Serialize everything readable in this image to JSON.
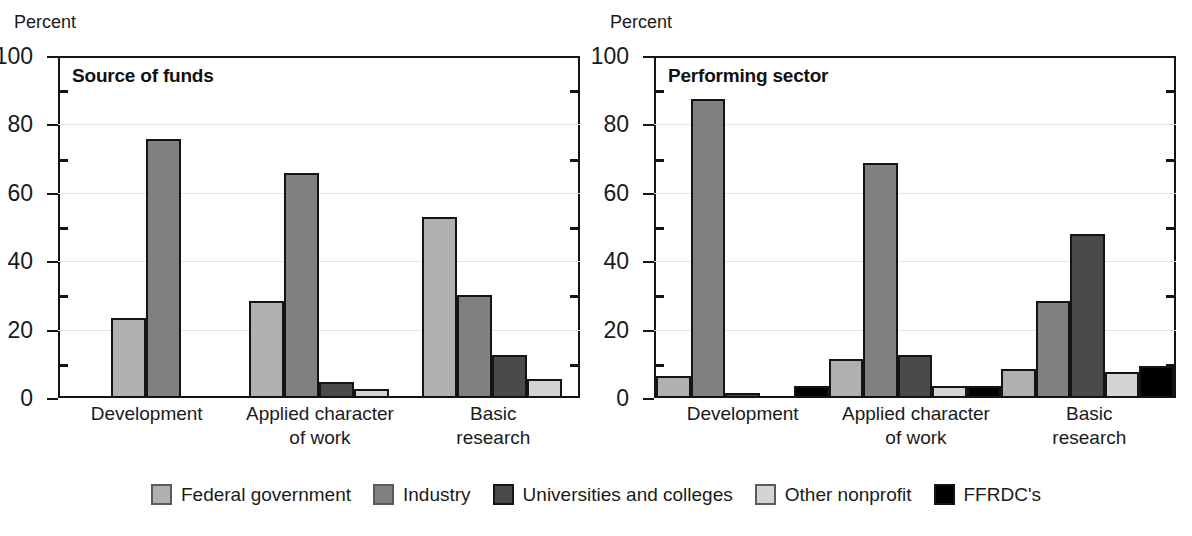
{
  "chart_data": {
    "type": "bar",
    "title": "",
    "panels": [
      {
        "title": "Source of funds",
        "ylabel": "Percent",
        "ylim": [
          0,
          100
        ],
        "yticks": [
          0,
          20,
          40,
          60,
          80,
          100
        ],
        "yticks_minor": [
          10,
          30,
          50,
          70,
          90
        ],
        "grid": true,
        "categories": [
          "Development",
          "Applied character of work",
          "Basic research"
        ],
        "series": [
          {
            "name": "Federal government",
            "values": [
              23,
              28,
              53
            ]
          },
          {
            "name": "Industry",
            "values": [
              76,
              66,
              30
            ]
          },
          {
            "name": "Universities and colleges",
            "values": [
              0,
              4,
              12
            ]
          },
          {
            "name": "Other nonprofit",
            "values": [
              0,
              2,
              5
            ]
          },
          {
            "name": "FFRDC's",
            "values": [
              0,
              0,
              0
            ]
          }
        ]
      },
      {
        "title": "Performing sector",
        "ylabel": "Percent",
        "ylim": [
          0,
          100
        ],
        "yticks": [
          0,
          20,
          40,
          60,
          80,
          100
        ],
        "yticks_minor": [
          10,
          30,
          50,
          70,
          90
        ],
        "grid": true,
        "categories": [
          "Development",
          "Applied character of work",
          "Basic research"
        ],
        "series": [
          {
            "name": "Federal government",
            "values": [
              6,
              11,
              8
            ]
          },
          {
            "name": "Industry",
            "values": [
              88,
              69,
              28
            ]
          },
          {
            "name": "Universities and colleges",
            "values": [
              1,
              12,
              48
            ]
          },
          {
            "name": "Other nonprofit",
            "values": [
              0,
              3,
              7
            ]
          },
          {
            "name": "FFRDC's",
            "values": [
              3,
              3,
              9
            ]
          }
        ]
      }
    ],
    "legend": {
      "position": "bottom",
      "entries": [
        {
          "label": "Federal government",
          "color": "#b0b0b0"
        },
        {
          "label": "Industry",
          "color": "#808080"
        },
        {
          "label": "Universities and colleges",
          "color": "#4a4a4a"
        },
        {
          "label": "Other nonprofit",
          "color": "#d4d4d4"
        },
        {
          "label": "FFRDC's",
          "color": "#000000"
        }
      ]
    }
  },
  "panels": [
    {
      "unit_label": "Percent",
      "title": "Source of funds",
      "yticks": [
        {
          "value": 100,
          "label": "100"
        },
        {
          "value": 80,
          "label": "80"
        },
        {
          "value": 60,
          "label": "60"
        },
        {
          "value": 40,
          "label": "40"
        },
        {
          "value": 20,
          "label": "20"
        },
        {
          "value": 0,
          "label": "0"
        }
      ],
      "categories": [
        {
          "line1": "Development",
          "line2": ""
        },
        {
          "line1": "Applied character",
          "line2": "of work"
        },
        {
          "line1": "Basic",
          "line2": "research"
        }
      ]
    },
    {
      "unit_label": "Percent",
      "title": "Performing sector",
      "yticks": [
        {
          "value": 100,
          "label": "100"
        },
        {
          "value": 80,
          "label": "80"
        },
        {
          "value": 60,
          "label": "60"
        },
        {
          "value": 40,
          "label": "40"
        },
        {
          "value": 20,
          "label": "20"
        },
        {
          "value": 0,
          "label": "0"
        }
      ],
      "categories": [
        {
          "line1": "Development",
          "line2": ""
        },
        {
          "line1": "Applied character",
          "line2": "of work"
        },
        {
          "line1": "Basic",
          "line2": "research"
        }
      ]
    }
  ],
  "legend": {
    "items": [
      {
        "label": "Federal government",
        "key": "federal"
      },
      {
        "label": "Industry",
        "key": "industry"
      },
      {
        "label": "Universities and colleges",
        "key": "universities"
      },
      {
        "label": "Other nonprofit",
        "key": "nonprofit"
      },
      {
        "label": "FFRDC's",
        "key": "ffrdc"
      }
    ]
  }
}
